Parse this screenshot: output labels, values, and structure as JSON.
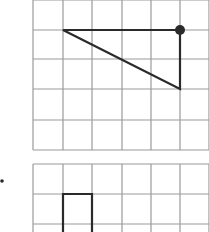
{
  "figure": {
    "grid_color": "#9a9a9a",
    "shape_color": "#2a2a2a",
    "top_grid": {
      "columns": 6,
      "rows": 5,
      "x_lines": [
        33,
        63,
        92,
        122,
        151,
        180,
        209
      ],
      "y_lines": [
        0,
        30,
        59,
        89,
        120,
        150
      ],
      "triangle": {
        "points": [
          [
            63,
            30
          ],
          [
            180,
            30
          ],
          [
            180,
            89
          ]
        ]
      },
      "marked_vertex": {
        "x": 180,
        "y": 30,
        "r": 5
      }
    },
    "bullet": {
      "x": 2,
      "y": 181,
      "r": 1.8
    },
    "bottom_grid": {
      "columns": 6,
      "x_lines": [
        33,
        63,
        92,
        122,
        151,
        180,
        209
      ],
      "y_lines": [
        164,
        194,
        224
      ],
      "rectangle": {
        "x1": 63,
        "y1": 194,
        "x2": 92,
        "y2": 240
      }
    }
  }
}
